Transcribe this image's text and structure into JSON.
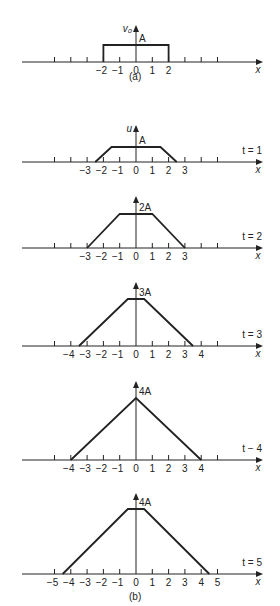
{
  "figure": {
    "ink_color": "#222222",
    "background": "#ffffff",
    "unit_px": 16.3,
    "origin_x": 136,
    "panel_a": {
      "caption": "(a)",
      "y_label": "v₀",
      "height_label": "A",
      "x_label": "x",
      "axis_y": 62,
      "top_y": 45,
      "arrow_top": 25,
      "ticks": [
        -5,
        -4,
        -3,
        -2,
        -1,
        0,
        1,
        2,
        3,
        4,
        5
      ],
      "tick_labels": [
        {
          "x": -2,
          "text": "−2"
        },
        {
          "x": -1,
          "text": "−1"
        },
        {
          "x": 0,
          "text": "0"
        },
        {
          "x": 1,
          "text": "1"
        },
        {
          "x": 2,
          "text": "2"
        }
      ],
      "shape": [
        [
          -2,
          0
        ],
        [
          -2,
          1
        ],
        [
          2,
          1
        ],
        [
          2,
          0
        ]
      ]
    },
    "panel_b": {
      "caption": "(b)",
      "caption_y": 600,
      "plots": [
        {
          "time_label": "t = 1",
          "y_label": "u",
          "height_label": "A",
          "x_label": "x",
          "axis_y": 162,
          "top_y": 147,
          "arrow_top": 125,
          "ticks": [
            -5,
            -4,
            -3,
            -2,
            -1,
            0,
            1,
            2,
            3,
            4,
            5
          ],
          "tick_labels": [
            {
              "x": -3,
              "text": "−3"
            },
            {
              "x": -2,
              "text": "−2"
            },
            {
              "x": -1,
              "text": "−1"
            },
            {
              "x": 0,
              "text": "0"
            },
            {
              "x": 1,
              "text": "1"
            },
            {
              "x": 2,
              "text": "2"
            },
            {
              "x": 3,
              "text": "3"
            }
          ],
          "shape": [
            [
              -2.5,
              0
            ],
            [
              -1.5,
              1
            ],
            [
              1.5,
              1
            ],
            [
              2.5,
              0
            ]
          ]
        },
        {
          "time_label": "t = 2",
          "y_label": "",
          "height_label": "2A",
          "x_label": "x",
          "axis_y": 248,
          "top_y": 214,
          "arrow_top": 196,
          "ticks": [
            -5,
            -4,
            -3,
            -2,
            -1,
            0,
            1,
            2,
            3,
            4,
            5
          ],
          "tick_labels": [
            {
              "x": -3,
              "text": "−3"
            },
            {
              "x": -2,
              "text": "−2"
            },
            {
              "x": -1,
              "text": "−1"
            },
            {
              "x": 0,
              "text": "0"
            },
            {
              "x": 1,
              "text": "1"
            },
            {
              "x": 2,
              "text": "2"
            },
            {
              "x": 3,
              "text": "3"
            }
          ],
          "shape": [
            [
              -3,
              0
            ],
            [
              -1,
              1
            ],
            [
              1,
              1
            ],
            [
              3,
              0
            ]
          ]
        },
        {
          "time_label": "t = 3",
          "y_label": "",
          "height_label": "3A",
          "x_label": "x",
          "axis_y": 346,
          "top_y": 299,
          "arrow_top": 282,
          "ticks": [
            -5,
            -4,
            -3,
            -2,
            -1,
            0,
            1,
            2,
            3,
            4,
            5
          ],
          "tick_labels": [
            {
              "x": -4,
              "text": "−4"
            },
            {
              "x": -3,
              "text": "−3"
            },
            {
              "x": -2,
              "text": "−2"
            },
            {
              "x": -1,
              "text": "−1"
            },
            {
              "x": 0,
              "text": "0"
            },
            {
              "x": 1,
              "text": "1"
            },
            {
              "x": 2,
              "text": "2"
            },
            {
              "x": 3,
              "text": "3"
            },
            {
              "x": 4,
              "text": "4"
            }
          ],
          "shape": [
            [
              -3.5,
              0
            ],
            [
              -0.5,
              1
            ],
            [
              0.5,
              1
            ],
            [
              3.5,
              0
            ]
          ]
        },
        {
          "time_label": "t − 4",
          "y_label": "",
          "height_label": "4A",
          "x_label": "x",
          "axis_y": 460,
          "top_y": 398,
          "arrow_top": 381,
          "ticks": [
            -5,
            -4,
            -3,
            -2,
            -1,
            0,
            1,
            2,
            3,
            4,
            5
          ],
          "tick_labels": [
            {
              "x": -4,
              "text": "−4"
            },
            {
              "x": -3,
              "text": "−3"
            },
            {
              "x": -2,
              "text": "−2"
            },
            {
              "x": -1,
              "text": "−1"
            },
            {
              "x": 0,
              "text": "0"
            },
            {
              "x": 1,
              "text": "1"
            },
            {
              "x": 2,
              "text": "2"
            },
            {
              "x": 3,
              "text": "3"
            },
            {
              "x": 4,
              "text": "4"
            }
          ],
          "shape": [
            [
              -4,
              0
            ],
            [
              0,
              1
            ],
            [
              4,
              0
            ]
          ]
        },
        {
          "time_label": "t = 5",
          "y_label": "",
          "height_label": "4A",
          "x_label": "x",
          "axis_y": 574,
          "top_y": 509,
          "arrow_top": 493,
          "ticks": [
            -5,
            -4,
            -3,
            -2,
            -1,
            0,
            1,
            2,
            3,
            4,
            5
          ],
          "tick_labels": [
            {
              "x": -5,
              "text": "−5"
            },
            {
              "x": -4,
              "text": "−4"
            },
            {
              "x": -3,
              "text": "−3"
            },
            {
              "x": -2,
              "text": "−2"
            },
            {
              "x": -1,
              "text": "−1"
            },
            {
              "x": 0,
              "text": "0"
            },
            {
              "x": 1,
              "text": "1"
            },
            {
              "x": 2,
              "text": "2"
            },
            {
              "x": 3,
              "text": "3"
            },
            {
              "x": 4,
              "text": "4"
            },
            {
              "x": 5,
              "text": "5"
            }
          ],
          "shape": [
            [
              -4.5,
              0
            ],
            [
              -0.5,
              1
            ],
            [
              0.5,
              1
            ],
            [
              4.5,
              0
            ]
          ]
        }
      ]
    }
  }
}
